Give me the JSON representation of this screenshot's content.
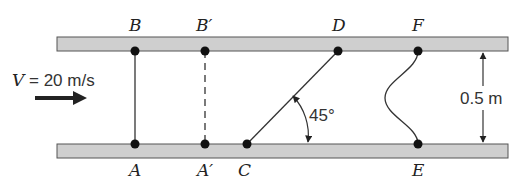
{
  "diagram": {
    "velocity_label": "V = 20 m/s",
    "gap_label": "0.5 m",
    "angle_label": "45°",
    "points": {
      "A": "A",
      "A_prime": "A′",
      "B": "B",
      "B_prime": "B′",
      "C": "C",
      "D": "D",
      "E": "E",
      "F": "F"
    },
    "colors": {
      "plate_fill": "#cfcfcf",
      "plate_stroke": "#555555",
      "line": "#333333",
      "dot": "#111111"
    }
  }
}
